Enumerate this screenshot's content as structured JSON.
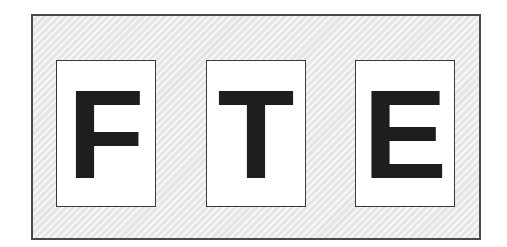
{
  "diagram": {
    "cards": [
      {
        "letter": "F"
      },
      {
        "letter": "T"
      },
      {
        "letter": "E"
      }
    ],
    "colors": {
      "outer_fill": "#ededed",
      "outer_border": "#4a4a4a",
      "card_fill": "#ffffff",
      "card_border": "#3a3a3a",
      "letter": "#1e1e1e"
    }
  }
}
